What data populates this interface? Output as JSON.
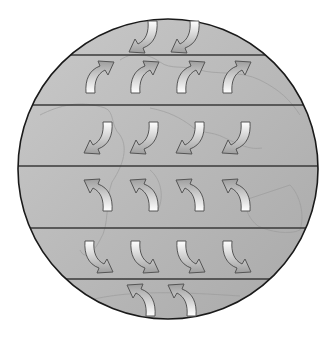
{
  "diagram": {
    "type": "global-wind-belts",
    "globe": {
      "cx": 168,
      "cy": 169,
      "r": 150,
      "fill_light": "#c9c9c9",
      "fill_dark": "#a9a9a9",
      "outline": "#1a1a1a",
      "continent_outline": "#9a9a9a"
    },
    "band_lines_y": [
      55,
      105,
      166,
      228,
      279
    ],
    "band_line_color": "#3a3a3a",
    "arrow_style": {
      "fill_top": "#ffffff",
      "fill_bottom": "#9e9e9e",
      "stroke": "#555555"
    },
    "bands": [
      {
        "name": "polar-easterlies-north",
        "direction": "down-left",
        "arrows": [
          {
            "x": 128,
            "y": 20
          },
          {
            "x": 170,
            "y": 20
          }
        ]
      },
      {
        "name": "westerlies-north",
        "direction": "up-right",
        "arrows": [
          {
            "x": 85,
            "y": 60
          },
          {
            "x": 130,
            "y": 60
          },
          {
            "x": 176,
            "y": 60
          },
          {
            "x": 222,
            "y": 60
          }
        ]
      },
      {
        "name": "trade-winds-north",
        "direction": "down-left",
        "arrows": [
          {
            "x": 83,
            "y": 121
          },
          {
            "x": 129,
            "y": 121
          },
          {
            "x": 175,
            "y": 121
          },
          {
            "x": 221,
            "y": 121
          }
        ]
      },
      {
        "name": "trade-winds-south",
        "direction": "up-left",
        "arrows": [
          {
            "x": 83,
            "y": 178
          },
          {
            "x": 129,
            "y": 178
          },
          {
            "x": 175,
            "y": 178
          },
          {
            "x": 221,
            "y": 178
          }
        ]
      },
      {
        "name": "westerlies-south",
        "direction": "down-right",
        "arrows": [
          {
            "x": 84,
            "y": 240
          },
          {
            "x": 130,
            "y": 240
          },
          {
            "x": 176,
            "y": 240
          },
          {
            "x": 222,
            "y": 240
          }
        ]
      },
      {
        "name": "polar-easterlies-south",
        "direction": "up-left",
        "arrows": [
          {
            "x": 126,
            "y": 283
          },
          {
            "x": 167,
            "y": 283
          }
        ]
      }
    ]
  }
}
